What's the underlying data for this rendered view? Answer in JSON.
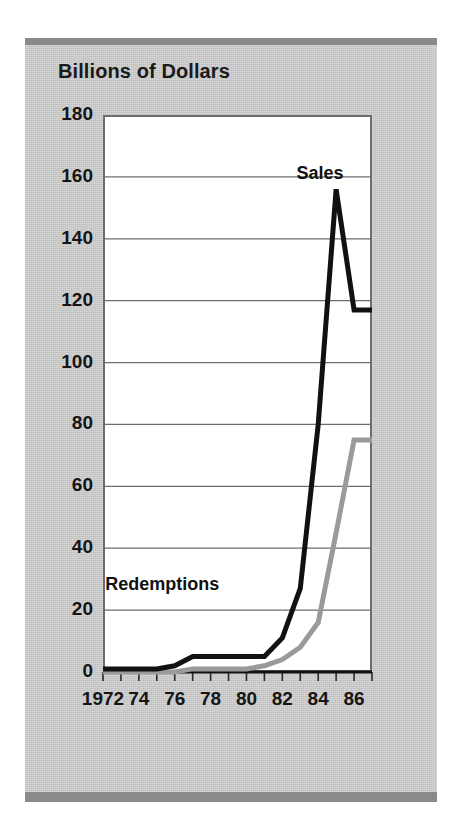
{
  "figure": {
    "panel_color": "#c9c9c9",
    "rule_color": "#8a8a8a",
    "plot_bg": "#ffffff",
    "frame_color": "#6d6d6d"
  },
  "axis_title": "Billions of Dollars",
  "top_fragment": "",
  "labels": {
    "sales": "Sales",
    "redemptions": "Redemptions"
  },
  "chart_data": {
    "type": "line",
    "title": "Billions of Dollars",
    "xlabel": "",
    "ylabel": "Billions of Dollars",
    "xlim": [
      1972,
      1987
    ],
    "ylim": [
      0,
      180
    ],
    "grid": true,
    "grid_axis": "y",
    "legend_position": "inline-annotation",
    "ytick_labels": [
      "180",
      "160",
      "140",
      "120",
      "100",
      "80",
      "60",
      "40",
      "20",
      "0"
    ],
    "ytick_values": [
      180,
      160,
      140,
      120,
      100,
      80,
      60,
      40,
      20,
      0
    ],
    "xtick_labels": [
      "1972",
      "74",
      "76",
      "78",
      "80",
      "82",
      "84",
      "86"
    ],
    "xtick_values": [
      1972,
      1974,
      1976,
      1978,
      1980,
      1982,
      1984,
      1986
    ],
    "minor_xticks_every": 1,
    "x": [
      1972,
      1973,
      1974,
      1975,
      1976,
      1977,
      1978,
      1979,
      1980,
      1981,
      1982,
      1983,
      1984,
      1985,
      1986,
      1987
    ],
    "series": [
      {
        "name": "Sales",
        "color": "#111111",
        "line_width": 5,
        "values": [
          1,
          1,
          1,
          1,
          2,
          5,
          5,
          5,
          5,
          5,
          11,
          27,
          80,
          156,
          117,
          117
        ]
      },
      {
        "name": "Redemptions",
        "color": "#9a9a9a",
        "line_width": 5,
        "values": [
          0,
          0,
          0,
          0,
          0,
          1,
          1,
          1,
          1,
          2,
          4,
          8,
          16,
          45,
          75,
          75
        ]
      }
    ],
    "annotations": [
      {
        "text": "Sales",
        "x": 1984.1,
        "y": 161
      },
      {
        "text": "Redemptions",
        "x": 1975.3,
        "y": 28
      }
    ]
  }
}
